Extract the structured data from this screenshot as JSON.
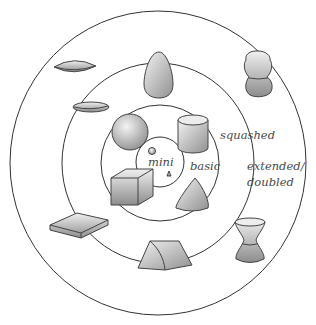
{
  "diagram": {
    "type": "concentric-rings",
    "rings": [
      {
        "id": "mini",
        "label": "mini"
      },
      {
        "id": "basic",
        "label": "basic"
      },
      {
        "id": "squashed",
        "label": "squashed"
      },
      {
        "id": "extended",
        "label": "extended/",
        "label2": "doubled"
      }
    ],
    "shapes": {
      "mini": [
        "small-sphere",
        "small-cone"
      ],
      "basic": [
        "sphere",
        "cylinder",
        "cube",
        "cone"
      ],
      "squashed": [
        "squashed-sphere-disc",
        "egg",
        "flat-box",
        "tent-prism"
      ],
      "extended": [
        "flat-lens",
        "double-sphere-bottle",
        "hourglass"
      ]
    },
    "colors": {
      "stroke": "#333333",
      "shape_light": "#e8e8e8",
      "shape_dark": "#8a8a8a",
      "text": "#4a4a4a"
    }
  }
}
